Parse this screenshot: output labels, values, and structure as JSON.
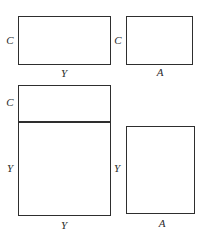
{
  "figure": {
    "title_fragment": "",
    "background_color": "#ffffff",
    "stroke_color": "#2e2e2e",
    "label_color": "#2b2b2b",
    "shapes": [
      {
        "id": "top-left-rectangle",
        "labels": {
          "left": "C",
          "bottom": "Y"
        }
      },
      {
        "id": "top-right-rectangle",
        "labels": {
          "left": "C",
          "bottom": "A"
        }
      },
      {
        "id": "bottom-left-split-rectangle",
        "labels": {
          "top_section_left": "C",
          "bottom_section_left": "Y",
          "bottom": "Y"
        }
      },
      {
        "id": "bottom-right-rectangle",
        "labels": {
          "left": "Y",
          "bottom": "A"
        }
      }
    ]
  }
}
